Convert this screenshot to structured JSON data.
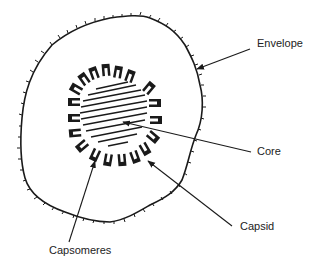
{
  "diagram": {
    "labels": {
      "envelope": "Envelope",
      "core": "Core",
      "capsid": "Capsid",
      "capsomeres": "Capsomeres"
    },
    "colors": {
      "line": "#1a1a1a",
      "background": "#ffffff"
    }
  }
}
